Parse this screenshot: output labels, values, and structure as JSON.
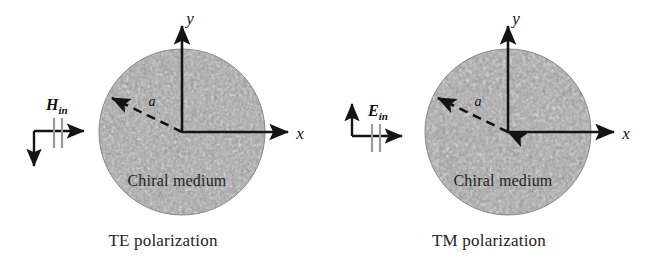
{
  "figure": {
    "background_color": "#ffffff",
    "ink_color": "#141414",
    "tick_color": "#8c8c8c",
    "medium_fill": "#9a9a9a",
    "panels": [
      {
        "id": "te",
        "caption": "TE polarization",
        "field_label": "H",
        "field_subscript": "in",
        "field_marker": {
          "horizontal_arrow": "right",
          "vertical_arrow": "down",
          "tick_count": 2
        },
        "circle": {
          "label": "Chiral medium",
          "center_x": 182,
          "center_y": 132,
          "radius": 83
        },
        "axes": {
          "x_label": "x",
          "y_label": "y"
        },
        "radius_arrow": {
          "label": "a",
          "style": "dashed",
          "heads": "single"
        }
      },
      {
        "id": "tm",
        "caption": "TM polarization",
        "field_label": "E",
        "field_subscript": "in",
        "field_marker": {
          "horizontal_arrow": "right",
          "vertical_arrow": "up",
          "tick_count": 2
        },
        "circle": {
          "label": "Chiral medium",
          "center_x": 182,
          "center_y": 132,
          "radius": 83
        },
        "axes": {
          "x_label": "x",
          "y_label": "y"
        },
        "radius_arrow": {
          "label": "a",
          "style": "dashed",
          "heads": "double"
        }
      }
    ]
  }
}
